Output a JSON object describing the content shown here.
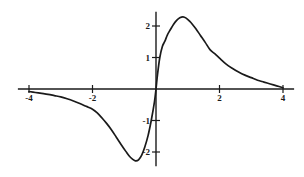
{
  "chart_data": {
    "type": "line",
    "title": "",
    "subtitle": "",
    "xlabel": "",
    "ylabel": "",
    "xlim": [
      -4.35,
      4.35
    ],
    "ylim": [
      -2.45,
      2.45
    ],
    "grid": false,
    "legend": null,
    "legend_position": "none",
    "axis_color": "#1a1a1a",
    "curve_color": "#1a1a1a",
    "background_color": "#ffffff",
    "x_ticks": [
      -4,
      -2,
      2,
      4
    ],
    "x_tick_labels": [
      "-4",
      "-2",
      "2",
      "4"
    ],
    "y_ticks": [
      -2,
      -1,
      1,
      2
    ],
    "y_tick_labels": [
      "-2",
      "-1",
      "1",
      "2"
    ],
    "annotations": [],
    "series": [
      {
        "name": "curve",
        "x": [
          -4.0,
          -3.8,
          -3.6,
          -3.4,
          -3.2,
          -3.0,
          -2.8,
          -2.6,
          -2.4,
          -2.2,
          -2.0,
          -1.85,
          -1.7,
          -1.55,
          -1.4,
          -1.25,
          -1.1,
          -0.95,
          -0.85,
          -0.75,
          -0.65,
          -0.55,
          -0.45,
          -0.35,
          -0.25,
          -0.15,
          -0.05,
          0.0,
          0.05,
          0.12,
          0.2,
          0.28,
          0.36,
          0.45,
          0.55,
          0.65,
          0.75,
          0.85,
          0.95,
          1.05,
          1.15,
          1.25,
          1.4,
          1.55,
          1.7,
          1.85,
          2.0,
          2.2,
          2.4,
          2.6,
          2.8,
          3.0,
          3.2,
          3.4,
          3.6,
          3.8,
          4.0
        ],
        "y": [
          -0.08,
          -0.11,
          -0.14,
          -0.17,
          -0.21,
          -0.25,
          -0.31,
          -0.38,
          -0.46,
          -0.55,
          -0.64,
          -0.76,
          -0.92,
          -1.1,
          -1.3,
          -1.53,
          -1.76,
          -1.98,
          -2.12,
          -2.22,
          -2.28,
          -2.25,
          -2.1,
          -1.83,
          -1.48,
          -1.0,
          -0.42,
          0.0,
          0.48,
          1.0,
          1.35,
          1.52,
          1.72,
          1.88,
          2.05,
          2.18,
          2.26,
          2.29,
          2.25,
          2.16,
          2.05,
          1.92,
          1.7,
          1.48,
          1.25,
          1.12,
          0.98,
          0.8,
          0.66,
          0.54,
          0.44,
          0.36,
          0.28,
          0.22,
          0.16,
          0.1,
          0.04
        ]
      }
    ]
  },
  "axes": {
    "x_axis_name": "horizontal-axis",
    "y_axis_name": "vertical-axis"
  }
}
